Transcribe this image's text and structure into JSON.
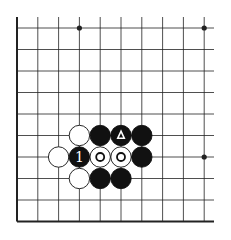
{
  "diagram": {
    "type": "go-board-fragment",
    "grid": {
      "columns": 10,
      "rows": 10,
      "x0": 17,
      "y0": 28,
      "spacing_x": 20.8,
      "spacing_y": 21.5,
      "right_extent": 214,
      "top_extent": 17,
      "thick_edges": [
        "left",
        "bottom"
      ]
    },
    "star_points": [
      {
        "col": 3,
        "row": 0
      },
      {
        "col": 9,
        "row": 0
      },
      {
        "col": 9,
        "row": 6
      }
    ],
    "stones": [
      {
        "col": 3,
        "row": 5,
        "color": "white",
        "mark": ""
      },
      {
        "col": 4,
        "row": 5,
        "color": "black",
        "mark": ""
      },
      {
        "col": 5,
        "row": 5,
        "color": "black",
        "mark": "triangle"
      },
      {
        "col": 6,
        "row": 5,
        "color": "black",
        "mark": ""
      },
      {
        "col": 2,
        "row": 6,
        "color": "white",
        "mark": ""
      },
      {
        "col": 3,
        "row": 6,
        "color": "black",
        "mark": "1"
      },
      {
        "col": 4,
        "row": 6,
        "color": "white",
        "mark": "circle"
      },
      {
        "col": 5,
        "row": 6,
        "color": "white",
        "mark": "circle"
      },
      {
        "col": 6,
        "row": 6,
        "color": "black",
        "mark": ""
      },
      {
        "col": 3,
        "row": 7,
        "color": "white",
        "mark": ""
      },
      {
        "col": 4,
        "row": 7,
        "color": "black",
        "mark": ""
      },
      {
        "col": 5,
        "row": 7,
        "color": "black",
        "mark": ""
      }
    ],
    "colors": {
      "line": "#222222",
      "black_stone": "#111111",
      "white_stone": "#ffffff",
      "background": "#ffffff"
    }
  }
}
